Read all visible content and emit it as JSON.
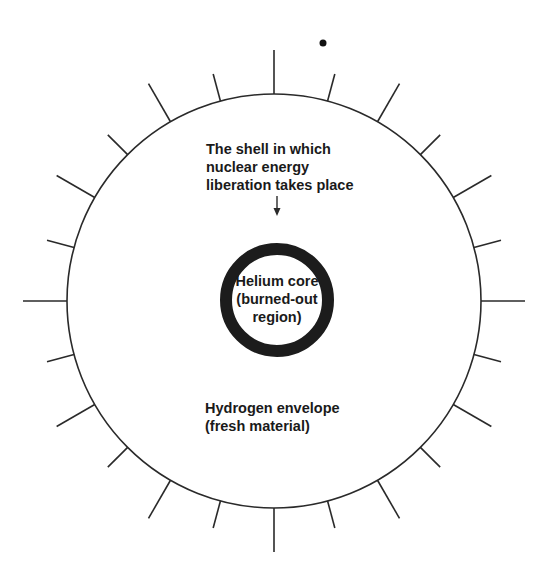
{
  "diagram": {
    "colors": {
      "ink": "#2a2a2a",
      "ring": "#1c1c1c",
      "background": "#ffffff"
    },
    "outer_circle": {
      "cx": 274,
      "cy": 301,
      "r": 207
    },
    "inner_ring": {
      "cx": 277,
      "cy": 300,
      "r": 51,
      "stroke_width": 12
    },
    "ticks": {
      "count": 24,
      "long": 44,
      "short": 28
    },
    "dot": {
      "cx": 323,
      "cy": 43,
      "r": 3.5
    }
  },
  "labels": {
    "shell": "The shell in which\nnuclear energy\nliberation takes place",
    "core": "Helium core\n(burned-out\nregion)",
    "envelope": "Hydrogen envelope\n(fresh material)"
  }
}
